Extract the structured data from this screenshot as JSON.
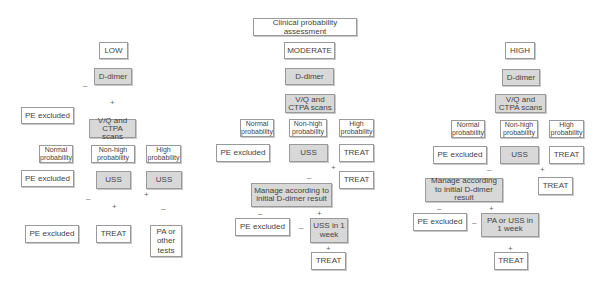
{
  "title": "Clinical probability assessment",
  "signs": {
    "plus": "+",
    "minus": "–"
  },
  "columns": {
    "low": {
      "label": "LOW",
      "d_dimer": "D-dimer",
      "pe_excluded_1": "PE excluded",
      "vq_scan": "V/Q and CTPA scans",
      "normal_prob": "Normal probability",
      "nonhigh_prob": "Non-high probability",
      "high_prob": "High probability",
      "pe_excluded_2": "PE excluded",
      "uss_1": "USS",
      "uss_2": "USS",
      "pe_excluded_3": "PE excluded",
      "treat": "TREAT",
      "pa_other": "PA or other tests"
    },
    "moderate": {
      "label": "MODERATE",
      "d_dimer": "D-dimer",
      "vq_scan": "V/Q and CTPA scans",
      "normal_prob": "Normal probability",
      "nonhigh_prob": "Non-high probability",
      "high_prob": "High probability",
      "pe_excluded_1": "PE excluded",
      "uss": "USS",
      "treat_1": "TREAT",
      "treat_2": "TREAT",
      "manage": "Manage according to initial D-dimer result",
      "pe_excluded_2": "PE excluded",
      "uss_week": "USS in 1 week",
      "treat_3": "TREAT"
    },
    "high": {
      "label": "HIGH",
      "d_dimer": "D-dimer",
      "vq_scan": "V/Q and CTPA scans",
      "normal_prob": "Normal probability",
      "nonhigh_prob": "Non-high probability",
      "high_prob": "High probability",
      "pe_excluded_1": "PE excluded",
      "uss": "USS",
      "treat_1": "TREAT",
      "treat_2": "TREAT",
      "manage": "Manage according to initial D-dimer result",
      "pe_excluded_2": "PE excluded",
      "pa_uss_week": "PA or USS in 1 week",
      "treat_3": "TREAT"
    }
  }
}
